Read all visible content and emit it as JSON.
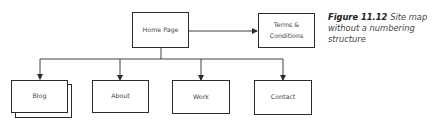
{
  "diagram": {
    "type": "site-map",
    "nodes": {
      "home": {
        "label": "Home Page"
      },
      "terms": {
        "label_line1": "Terms &",
        "label_line2": "Conditions"
      },
      "blog": {
        "label": "Blog",
        "stacked": true
      },
      "about": {
        "label": "About"
      },
      "work": {
        "label": "Work"
      },
      "contact": {
        "label": "Contact"
      }
    },
    "edges": [
      {
        "from": "Home Page",
        "to": "Terms & Conditions"
      },
      {
        "from": "Home Page",
        "to": "Blog"
      },
      {
        "from": "Home Page",
        "to": "About"
      },
      {
        "from": "Home Page",
        "to": "Work"
      },
      {
        "from": "Home Page",
        "to": "Contact"
      }
    ],
    "colors": {
      "line": "#2b2b2b",
      "box_border": "#2b2b2b",
      "text": "#444444",
      "background": "#ffffff"
    }
  },
  "caption": {
    "figure_label": "Figure 11.12",
    "text": "Site map without a numbering structure"
  }
}
